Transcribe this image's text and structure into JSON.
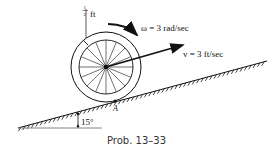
{
  "figure": {
    "caption": "Prob. 13–33",
    "labels": {
      "thickness": "ft",
      "thickness_num": "1",
      "thickness_den": "2",
      "omega": "ω = 3 rad/sec",
      "velocity": "v = 3 ft/sec",
      "contact_point": "A",
      "angle": "15°"
    },
    "wheel": {
      "spokes": 16
    },
    "colors": {
      "ink": "#111111",
      "background": "#ffffff"
    }
  }
}
